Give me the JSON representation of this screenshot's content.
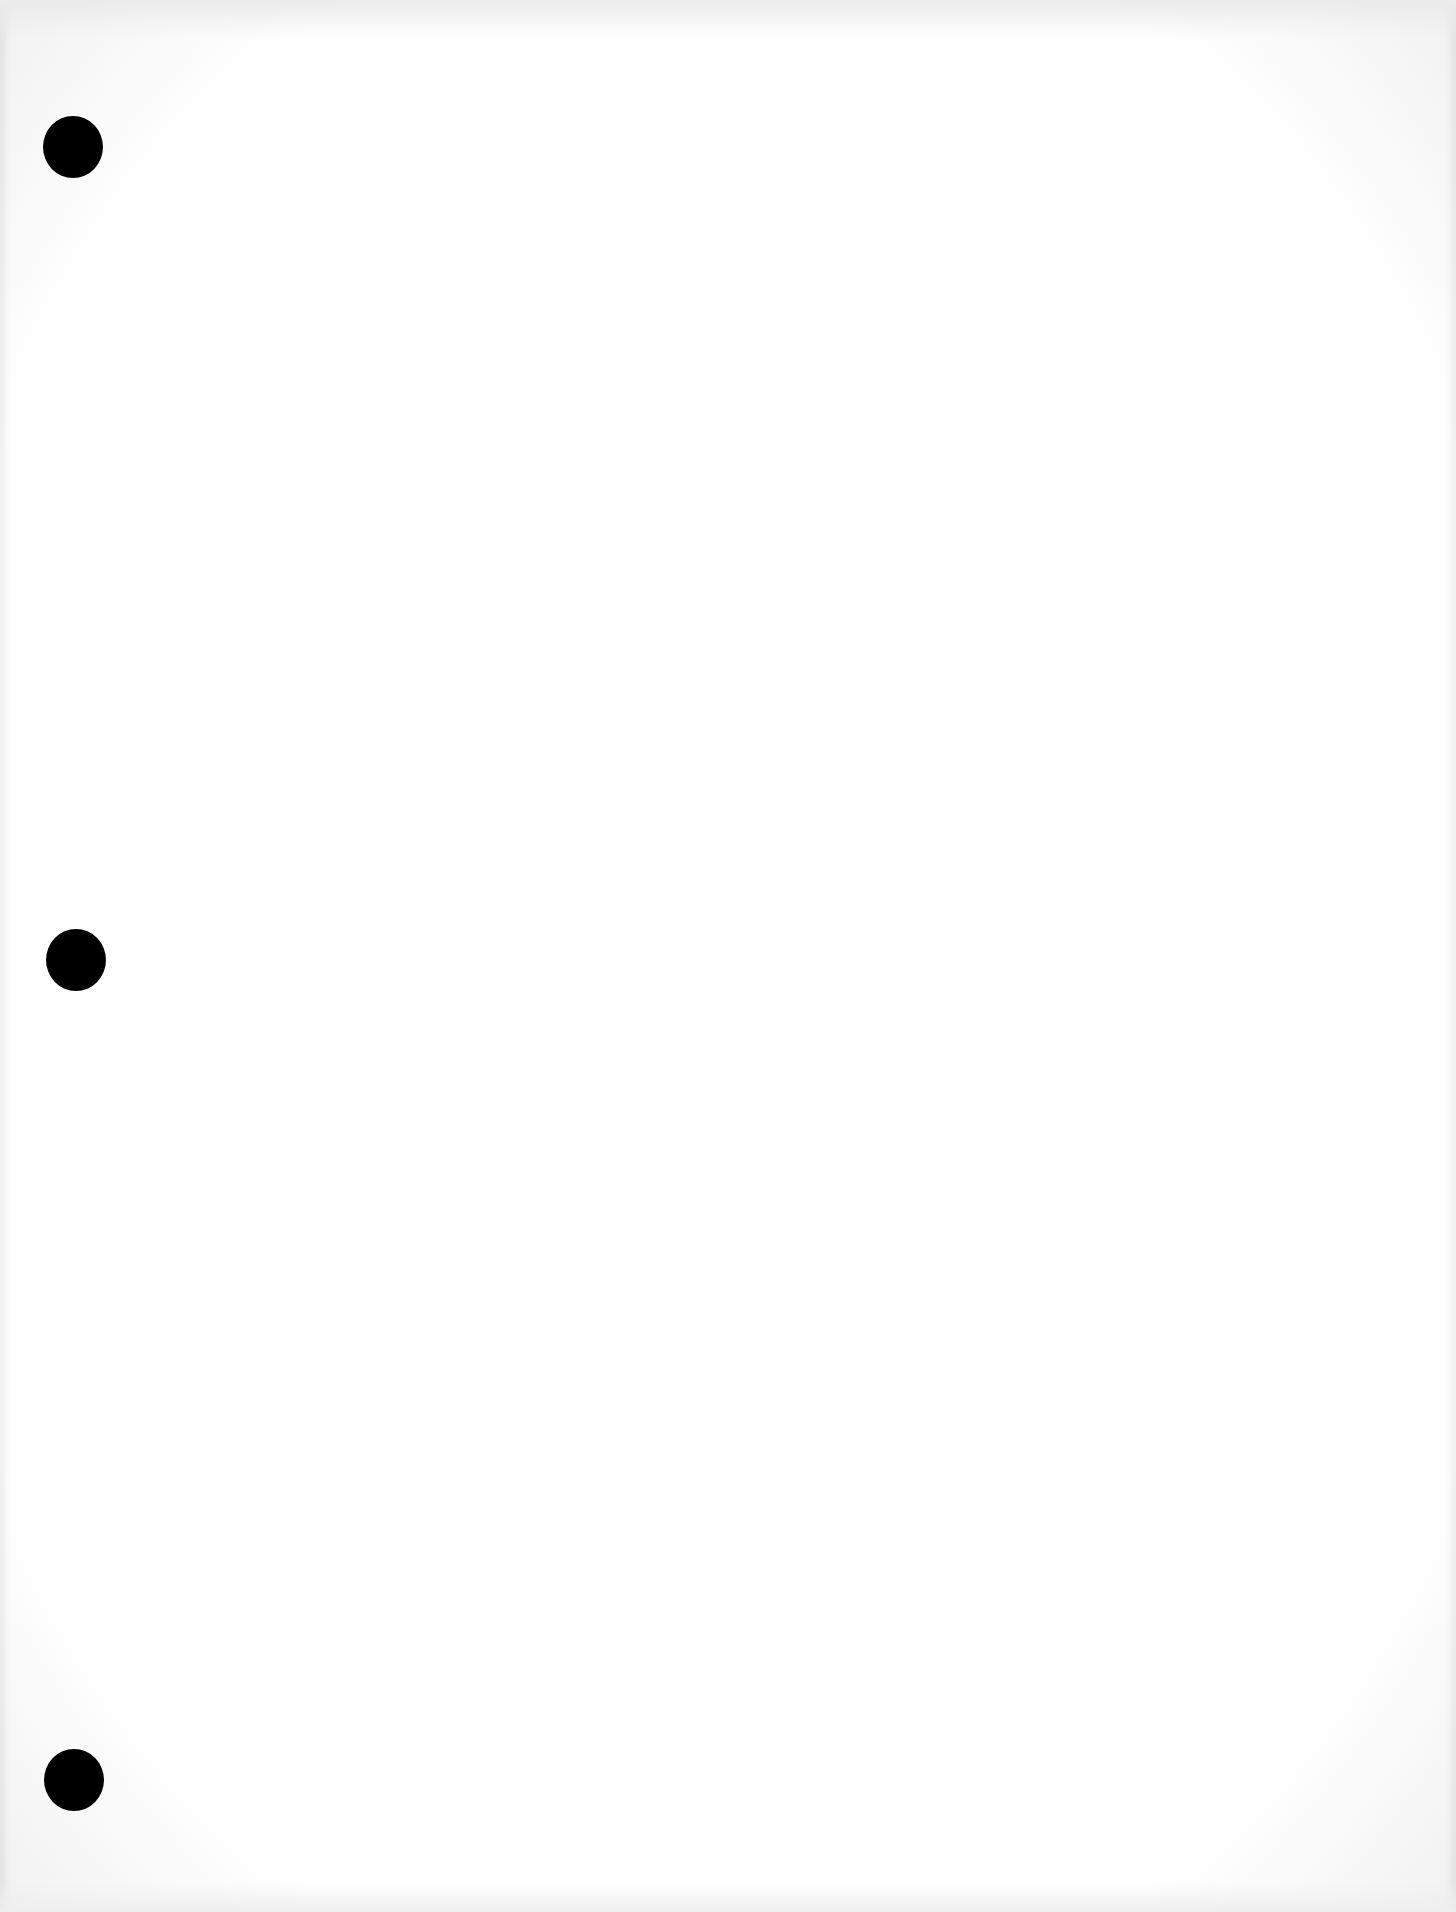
{
  "document": {
    "type": "blank-page",
    "background_color": "#ffffff",
    "text_content": "",
    "punch_holes": [
      {
        "x": 43,
        "y": 116
      },
      {
        "x": 46,
        "y": 929
      },
      {
        "x": 44,
        "y": 1749
      }
    ],
    "punch_hole_color": "#000000"
  }
}
